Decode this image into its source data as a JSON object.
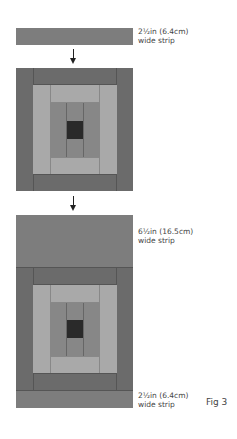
{
  "figure": {
    "label": "Fig 3",
    "top_strip": {
      "line1": "2½in (6.4cm)",
      "line2": "wide strip"
    },
    "middle_strip": {
      "line1": "6½in (16.5cm)",
      "line2": "wide strip"
    },
    "bottom_strip": {
      "line1": "2½in (6.4cm)",
      "line2": "wide strip"
    },
    "steps": [
      "strip",
      "arrow",
      "log-cabin-block",
      "arrow",
      "extended-block"
    ]
  },
  "colors": {
    "dark": "#6b6b6b",
    "medium": "#878787",
    "light": "#a9a9a9",
    "center": "#2a2a2a",
    "strip": "#7d7d7d"
  }
}
